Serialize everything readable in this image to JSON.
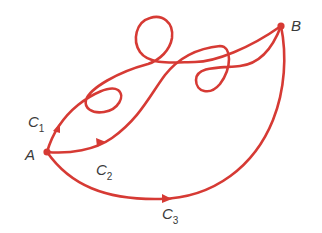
{
  "diagram": {
    "title": "",
    "curve_color": "#d63a34",
    "label_color": "#3a3a3a",
    "points": [
      {
        "id": "A",
        "label": "A",
        "x": 47,
        "y": 152
      },
      {
        "id": "B",
        "label": "B",
        "x": 281,
        "y": 26
      }
    ],
    "curves": [
      {
        "id": "C1",
        "label": "C",
        "subscript": "1",
        "from": "A",
        "to": "B"
      },
      {
        "id": "C2",
        "label": "C",
        "subscript": "2",
        "from": "A",
        "to": "B"
      },
      {
        "id": "C3",
        "label": "C",
        "subscript": "3",
        "from": "A",
        "to": "B"
      }
    ]
  }
}
